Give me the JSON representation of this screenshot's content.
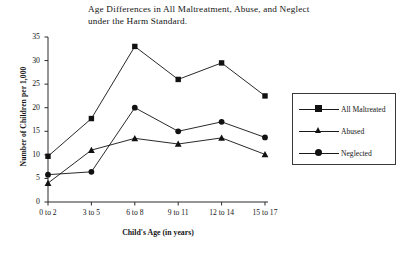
{
  "chart_data": {
    "type": "line",
    "title": "Age Differences in All Maltreatment, Abuse, and Neglect under the Harm Standard.",
    "title_line1": "Age Differences in All Maltreatment, Abuse, and Neglect",
    "title_line2": "under the Harm Standard.",
    "xlabel": "Child's Age (in years)",
    "ylabel": "Number of Children per 1,000",
    "categories": [
      "0 to 2",
      "3 to 5",
      "6 to 8",
      "9 to 11",
      "12 to 14",
      "15 to 17"
    ],
    "ylim": [
      0,
      35
    ],
    "yticks": [
      0,
      5,
      10,
      15,
      20,
      25,
      30,
      35
    ],
    "grid": false,
    "legend_position": "right",
    "series": [
      {
        "name": "All Maltreated",
        "marker": "square",
        "color": "#111111",
        "values": [
          9.7,
          17.7,
          33.0,
          26.0,
          29.5,
          22.5
        ]
      },
      {
        "name": "Abused",
        "marker": "triangle",
        "color": "#111111",
        "values": [
          4.0,
          11.0,
          13.5,
          12.3,
          13.6,
          10.1
        ]
      },
      {
        "name": "Neglected",
        "marker": "circle",
        "color": "#111111",
        "values": [
          5.8,
          6.4,
          20.0,
          15.0,
          17.0,
          13.7
        ]
      }
    ]
  }
}
